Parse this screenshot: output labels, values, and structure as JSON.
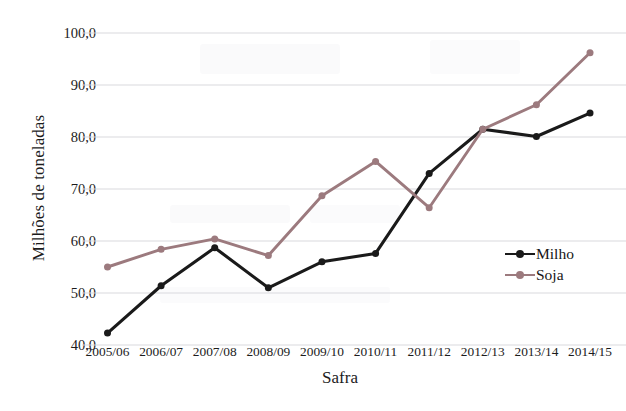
{
  "chart_data": {
    "type": "line",
    "title": "",
    "xlabel": "Safra",
    "ylabel": "Milhões de toneladas",
    "categories": [
      "2005/06",
      "2006/07",
      "2007/08",
      "2008/09",
      "2009/10",
      "2010/11",
      "2011/12",
      "2012/13",
      "2013/14",
      "2014/15"
    ],
    "ylim": [
      40.0,
      100.0
    ],
    "yticks": [
      "40,0",
      "50,0",
      "60,0",
      "70,0",
      "80,0",
      "90,0",
      "100,0"
    ],
    "ytick_values": [
      40.0,
      50.0,
      60.0,
      70.0,
      80.0,
      90.0,
      100.0
    ],
    "grid": true,
    "legend_position": "right-middle",
    "series": [
      {
        "name": "Milho",
        "color": "#1a1a1a",
        "marker": "circle",
        "values": [
          42.3,
          51.4,
          58.7,
          51.0,
          56.0,
          57.6,
          73.0,
          81.5,
          80.1,
          84.6
        ]
      },
      {
        "name": "Soja",
        "color": "#9c7a7e",
        "marker": "circle",
        "values": [
          55.0,
          58.4,
          60.4,
          57.2,
          68.7,
          75.3,
          66.4,
          81.5,
          86.2,
          96.2
        ]
      }
    ]
  },
  "legend": {
    "items": [
      {
        "label": "Milho",
        "color": "#1a1a1a"
      },
      {
        "label": "Soja",
        "color": "#9c7a7e"
      }
    ]
  },
  "axes": {
    "x_title": "Safra",
    "y_title": "Milhões de toneladas"
  },
  "colors": {
    "milho": "#1a1a1a",
    "soja": "#9c7a7e",
    "gridline": "#d9d9de",
    "background": "#ffffff",
    "text": "#1c1c1c"
  }
}
